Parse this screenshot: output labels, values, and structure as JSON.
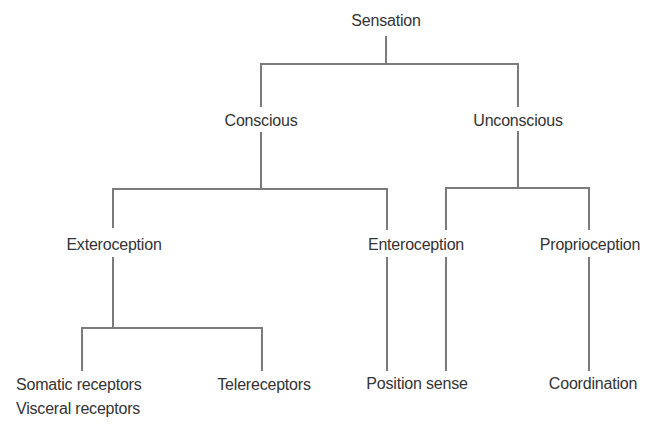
{
  "diagram": {
    "type": "tree",
    "colors": {
      "line": "#7b7b7b",
      "text": "#333333",
      "background": "#ffffff"
    },
    "root": {
      "label": "Sensation",
      "children": [
        {
          "label": "Conscious",
          "children": [
            {
              "label": "Exteroception",
              "children": [
                {
                  "label": "Somatic receptors",
                  "label2": "Visceral receptors"
                },
                {
                  "label": "Telereceptors"
                }
              ]
            },
            {
              "label": "Enteroception"
            }
          ]
        },
        {
          "label": "Unconscious",
          "children": [
            {
              "label": "Position sense"
            },
            {
              "label": "Proprioception",
              "children": [
                {
                  "label": "Coordination"
                }
              ]
            }
          ]
        }
      ]
    },
    "shared_leaf_note": "Enteroception and Unconscious both connect down to Position sense"
  }
}
